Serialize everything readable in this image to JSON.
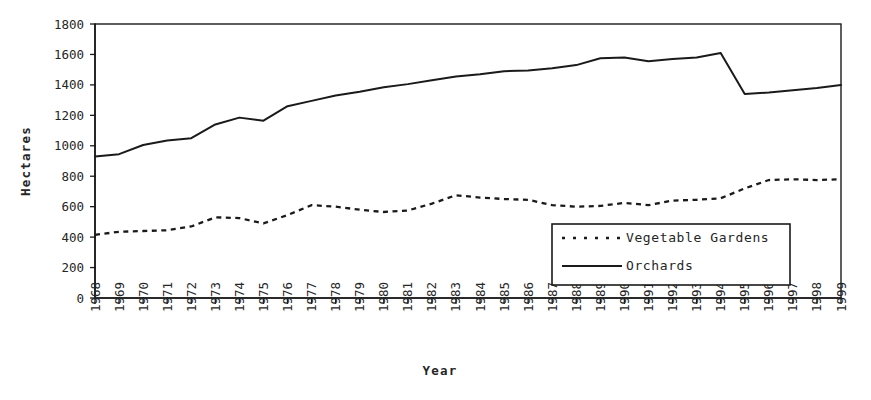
{
  "chart_data": {
    "type": "line",
    "title": "",
    "xlabel": "Year",
    "ylabel": "Hectares",
    "grid": false,
    "legend_position": "inside-lower-right",
    "xlim": [
      1968,
      1999
    ],
    "ylim": [
      0,
      1800
    ],
    "ytick_step": 200,
    "yticks": [
      "0",
      "200",
      "400",
      "600",
      "800",
      "1000",
      "1200",
      "1400",
      "1600",
      "1800"
    ],
    "categories": [
      "1968",
      "1969",
      "1970",
      "1971",
      "1972",
      "1973",
      "1974",
      "1975",
      "1976",
      "1977",
      "1978",
      "1979",
      "1980",
      "1981",
      "1982",
      "1983",
      "1984",
      "1985",
      "1986",
      "1987",
      "1988",
      "1989",
      "1990",
      "1991",
      "1992",
      "1993",
      "1994",
      "1995",
      "1996",
      "1997",
      "1998",
      "1999"
    ],
    "series": [
      {
        "name": "Vegetable Gardens",
        "style": "dotted",
        "color": "#1a1a1a",
        "values": [
          415,
          435,
          440,
          445,
          470,
          530,
          525,
          490,
          545,
          610,
          600,
          580,
          565,
          575,
          620,
          675,
          660,
          650,
          645,
          610,
          600,
          605,
          625,
          610,
          640,
          645,
          655,
          720,
          775,
          780,
          775,
          780
        ]
      },
      {
        "name": "Orchards",
        "style": "solid",
        "color": "#1a1a1a",
        "values": [
          930,
          945,
          1005,
          1035,
          1050,
          1140,
          1185,
          1165,
          1260,
          1295,
          1330,
          1355,
          1385,
          1405,
          1430,
          1455,
          1470,
          1490,
          1495,
          1510,
          1530,
          1575,
          1580,
          1555,
          1570,
          1580,
          1610,
          1340,
          1350,
          1365,
          1380,
          1400
        ]
      }
    ]
  },
  "legend": {
    "entries": [
      {
        "label": "Vegetable Gardens",
        "style": "dotted"
      },
      {
        "label": "Orchards",
        "style": "solid"
      }
    ]
  },
  "axes": {
    "y_title": "Hectares",
    "x_title": "Year"
  }
}
